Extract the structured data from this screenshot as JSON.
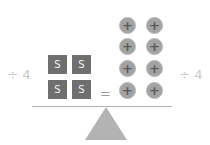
{
  "equation": {
    "left_operation": "÷ 4",
    "right_operation": "÷ 4",
    "equals": "=",
    "left_side": {
      "type": "variable-tiles",
      "count": 4,
      "label": "S",
      "tiles": [
        "S",
        "S",
        "S",
        "S"
      ]
    },
    "right_side": {
      "type": "positive-unit-counters",
      "count": 8,
      "symbol": "+",
      "counters": [
        "+",
        "+",
        "+",
        "+",
        "+",
        "+",
        "+",
        "+"
      ]
    }
  },
  "colors": {
    "tile": "#6f6f6f",
    "counter": "#a3a3a3",
    "fulcrum": "#b3b3b3",
    "beam": "#b5b5b5",
    "operation_text": "#c8c8c8"
  }
}
